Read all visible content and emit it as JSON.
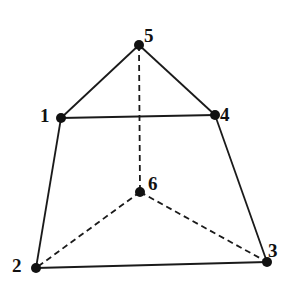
{
  "diagram": {
    "type": "polyhedron-wireframe",
    "vertices": [
      {
        "id": "1",
        "label": "1",
        "x": 61,
        "y": 118,
        "lx": 40,
        "ly": 122
      },
      {
        "id": "2",
        "label": "2",
        "x": 36,
        "y": 268,
        "lx": 12,
        "ly": 272
      },
      {
        "id": "3",
        "label": "3",
        "x": 267,
        "y": 262,
        "lx": 268,
        "ly": 257
      },
      {
        "id": "4",
        "label": "4",
        "x": 215,
        "y": 115,
        "lx": 220,
        "ly": 121
      },
      {
        "id": "5",
        "label": "5",
        "x": 139,
        "y": 45,
        "lx": 144,
        "ly": 42
      },
      {
        "id": "6",
        "label": "6",
        "x": 140,
        "y": 192,
        "lx": 148,
        "ly": 190
      }
    ],
    "edges": [
      {
        "from": "1",
        "to": "5",
        "style": "solid"
      },
      {
        "from": "5",
        "to": "4",
        "style": "solid"
      },
      {
        "from": "1",
        "to": "4",
        "style": "solid"
      },
      {
        "from": "1",
        "to": "2",
        "style": "solid"
      },
      {
        "from": "4",
        "to": "3",
        "style": "solid"
      },
      {
        "from": "2",
        "to": "3",
        "style": "solid"
      },
      {
        "from": "5",
        "to": "6",
        "style": "dashed"
      },
      {
        "from": "6",
        "to": "2",
        "style": "dashed"
      },
      {
        "from": "6",
        "to": "3",
        "style": "dashed"
      }
    ],
    "colors": {
      "stroke": "#1a1a1a",
      "vertex": "#111111",
      "background": "#ffffff"
    }
  }
}
